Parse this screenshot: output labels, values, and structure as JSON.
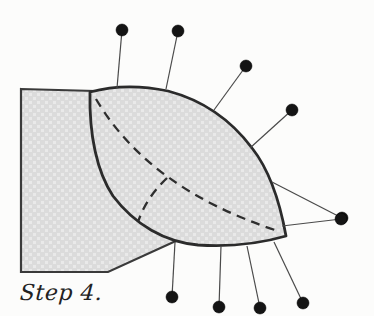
{
  "caption": {
    "text": "Step 4."
  },
  "colors": {
    "background": "#fcfcfb",
    "shape_fill": "#dbdbdb",
    "shape_fill_light": "#e9e9e9",
    "outline": "#2b2b2b",
    "board_outline": "#3a3a3a",
    "fold_line": "#2e2e2e",
    "pin_stem": "#4a4a4a",
    "pin_head": "#141414"
  },
  "illustration": {
    "board": {
      "points": "21,89 95,91 178,240 108,272 21,272"
    },
    "leaf": {
      "path": "M90,92 C112,86 140,85 168,91 C202,100 231,120 252,148 C267,167 279,197 286,236 C262,243 230,247 198,245 C165,242 135,225 113,196 C97,172 89,135 90,92 Z"
    },
    "fold_lines": [
      {
        "path": "M96,99 Q149,189 278,231"
      },
      {
        "path": "M167,178 Q146,198 138,222"
      }
    ],
    "pins": [
      {
        "x1": 117,
        "y1": 88,
        "x2": 122,
        "y2": 30
      },
      {
        "x1": 166,
        "y1": 89,
        "x2": 178,
        "y2": 31
      },
      {
        "x1": 214,
        "y1": 110,
        "x2": 246,
        "y2": 66
      },
      {
        "x1": 250,
        "y1": 148,
        "x2": 292,
        "y2": 110
      },
      {
        "x1": 272,
        "y1": 182,
        "x2": 342,
        "y2": 218
      },
      {
        "x1": 282,
        "y1": 226,
        "x2": 341,
        "y2": 219
      },
      {
        "x1": 175,
        "y1": 242,
        "x2": 172,
        "y2": 297
      },
      {
        "x1": 221,
        "y1": 246,
        "x2": 219,
        "y2": 307
      },
      {
        "x1": 247,
        "y1": 246,
        "x2": 260,
        "y2": 308
      },
      {
        "x1": 274,
        "y1": 242,
        "x2": 303,
        "y2": 303
      }
    ],
    "pin_head_radius": 6
  }
}
